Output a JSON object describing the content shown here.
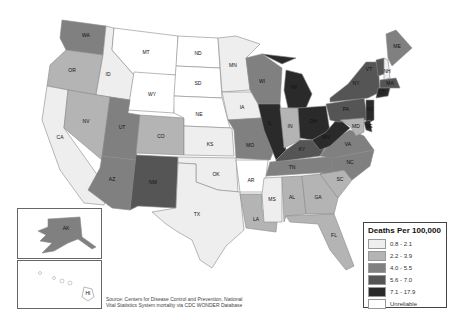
{
  "legend": {
    "title": "Deaths Per 100,000",
    "bins": [
      {
        "label": "0.8 - 2.1",
        "color": "#eeeeee"
      },
      {
        "label": "2.2 - 3.9",
        "color": "#b4b4b4"
      },
      {
        "label": "4.0 - 5.5",
        "color": "#808080"
      },
      {
        "label": "5.6 - 7.0",
        "color": "#555555"
      },
      {
        "label": "7.1 - 17.9",
        "color": "#2a2a2a"
      },
      {
        "label": "Unreliable",
        "color": "#ffffff"
      }
    ]
  },
  "source": {
    "line1": "Source: Centers for Disease Control and Prevention, National",
    "line2": "Vital Statistics System mortality via CDC WONDER Database"
  },
  "states": {
    "WA": {
      "label": "WA",
      "bin": 3
    },
    "OR": {
      "label": "OR",
      "bin": 2
    },
    "CA": {
      "label": "CA",
      "bin": 1
    },
    "ID": {
      "label": "ID",
      "bin": 1
    },
    "NV": {
      "label": "NV",
      "bin": 2
    },
    "MT": {
      "label": "MT",
      "bin": 6
    },
    "WY": {
      "label": "WY",
      "bin": 6
    },
    "UT": {
      "label": "UT",
      "bin": 3
    },
    "AZ": {
      "label": "AZ",
      "bin": 3
    },
    "CO": {
      "label": "CO",
      "bin": 2
    },
    "NM": {
      "label": "NM",
      "bin": 4
    },
    "ND": {
      "label": "ND",
      "bin": 6
    },
    "SD": {
      "label": "SD",
      "bin": 6
    },
    "NE": {
      "label": "NE",
      "bin": 6
    },
    "KS": {
      "label": "KS",
      "bin": 1
    },
    "OK": {
      "label": "OK",
      "bin": 1
    },
    "TX": {
      "label": "TX",
      "bin": 1
    },
    "MN": {
      "label": "MN",
      "bin": 1
    },
    "IA": {
      "label": "IA",
      "bin": 1
    },
    "MO": {
      "label": "MO",
      "bin": 3
    },
    "AR": {
      "label": "AR",
      "bin": 6
    },
    "LA": {
      "label": "LA",
      "bin": 2
    },
    "WI": {
      "label": "WI",
      "bin": 3
    },
    "IL": {
      "label": "IL",
      "bin": 5
    },
    "MI": {
      "label": "MI",
      "bin": 5
    },
    "IN": {
      "label": "IN",
      "bin": 2
    },
    "OH": {
      "label": "OH",
      "bin": 5
    },
    "KY": {
      "label": "KY",
      "bin": 4
    },
    "TN": {
      "label": "TN",
      "bin": 3
    },
    "MS": {
      "label": "MS",
      "bin": 1
    },
    "AL": {
      "label": "AL",
      "bin": 2
    },
    "GA": {
      "label": "GA",
      "bin": 2
    },
    "FL": {
      "label": "FL",
      "bin": 2
    },
    "SC": {
      "label": "SC",
      "bin": 2
    },
    "NC": {
      "label": "NC",
      "bin": 3
    },
    "VA": {
      "label": "VA",
      "bin": 3
    },
    "WV": {
      "label": "WV",
      "bin": 5
    },
    "PA": {
      "label": "PA",
      "bin": 4
    },
    "NY": {
      "label": "NY",
      "bin": 4
    },
    "VT": {
      "label": "VT",
      "bin": 4
    },
    "NH": {
      "label": "NH",
      "bin": 1
    },
    "ME": {
      "label": "ME",
      "bin": 3
    },
    "MA": {
      "label": "MA",
      "bin": 4
    },
    "CT": {
      "label": "CT",
      "bin": 5
    },
    "NJ": {
      "label": "NJ",
      "bin": 5
    },
    "DE": {
      "label": "DE",
      "bin": 5
    },
    "MD": {
      "label": "MD",
      "bin": 2
    },
    "AK": {
      "label": "AK",
      "bin": 3
    },
    "HI": {
      "label": "HI",
      "bin": 6
    }
  }
}
